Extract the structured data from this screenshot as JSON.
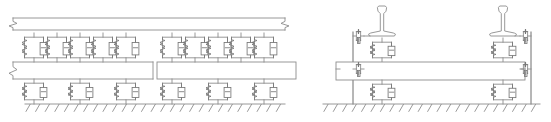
{
  "figure": {
    "background_color": "#ffffff",
    "line_color": "#8d8d8d",
    "width": 551,
    "height": 122
  },
  "panels": [
    {
      "id": "longitudinal-view",
      "name": "Longitudinal side view of floating slab track",
      "x": 0,
      "y": 0,
      "width": 296,
      "height": 122,
      "rail_beam": {
        "name": "rail-beam",
        "x": 13,
        "y": 18,
        "width": 272,
        "height": 12,
        "left_break_symbol": true,
        "right_break_symbol": true
      },
      "rail_pads": {
        "name": "rail-pad-spring-damper",
        "count": 10,
        "y_top": 33,
        "y_bottom": 62,
        "element_width": 19,
        "element_height": 17,
        "x_positions": [
          34,
          57,
          80,
          103,
          126,
          172,
          195,
          218,
          241,
          264
        ]
      },
      "slab_segments": [
        {
          "name": "slab-segment-left",
          "x": 13,
          "y": 62,
          "width": 140,
          "height": 17,
          "left_break_symbol": true
        },
        {
          "name": "slab-segment-right",
          "x": 157,
          "y": 62,
          "width": 139,
          "height": 17,
          "left_break_symbol": false
        }
      ],
      "slab_gap": {
        "name": "slab-joint-gap",
        "x": 153,
        "width": 4
      },
      "slab_bearings": {
        "name": "slab-bearing-spring-damper",
        "count": 6,
        "y_top": 79,
        "y_bottom": 104,
        "element_width": 19,
        "element_height": 17,
        "x_positions": [
          34,
          80,
          126,
          172,
          218,
          264
        ]
      },
      "ground": {
        "name": "ground-support",
        "line_y": 104,
        "x_start": 25,
        "x_end": 285,
        "hatch_count": 27,
        "hatch_length": 9,
        "hatch_angle_deg": 60
      }
    },
    {
      "id": "cross-section-view",
      "name": "Transverse cross-section view of floating slab track",
      "x": 300,
      "y": 0,
      "width": 251,
      "height": 122,
      "rails": [
        {
          "name": "rail-profile-left",
          "center_x": 382,
          "base_y": 36,
          "head_y": 6
        },
        {
          "name": "rail-profile-right",
          "center_x": 503,
          "base_y": 36,
          "head_y": 6
        }
      ],
      "lateral_walls": [
        {
          "name": "lateral-wall-left",
          "x": 353,
          "y_top": 32,
          "y_bottom": 104
        },
        {
          "name": "lateral-wall-right",
          "x": 531,
          "y_top": 32,
          "y_bottom": 104
        }
      ],
      "lateral_springs": [
        {
          "name": "lateral-spring-rail-left",
          "x": 357,
          "y": 36
        },
        {
          "name": "lateral-spring-rail-right",
          "x": 527,
          "y": 36
        },
        {
          "name": "lateral-spring-slab-left",
          "x": 340,
          "y": 69
        },
        {
          "name": "lateral-spring-slab-right",
          "x": 521,
          "y": 69
        }
      ],
      "rail_pads": {
        "name": "rail-pad-spring-damper",
        "count": 2,
        "y_top": 38,
        "y_bottom": 62,
        "x_positions": [
          382,
          503
        ]
      },
      "slab": {
        "name": "slab-cross-section",
        "x": 336,
        "y": 62,
        "width": 189,
        "height": 18
      },
      "slab_bearings": {
        "name": "slab-bearing-spring-damper",
        "count": 2,
        "y_top": 80,
        "y_bottom": 104,
        "x_positions": [
          382,
          503
        ]
      },
      "ground": {
        "name": "ground-support",
        "line_y": 104,
        "x_start": 323,
        "x_end": 540,
        "hatch_count": 23,
        "hatch_length": 9,
        "hatch_angle_deg": 60
      }
    }
  ],
  "symbols": {
    "spring": {
      "name": "coil-spring-symbol",
      "description": "zigzag coil spring representing stiffness"
    },
    "damper": {
      "name": "dashpot-damper-symbol",
      "description": "piston-in-cylinder dashpot representing viscous damping"
    },
    "break": {
      "name": "break-line-symbol",
      "description": "zigzag break indicating the member continues"
    },
    "ground_hatch": {
      "name": "fixed-support-hatch",
      "description": "inclined hatching denoting rigid foundation"
    }
  }
}
